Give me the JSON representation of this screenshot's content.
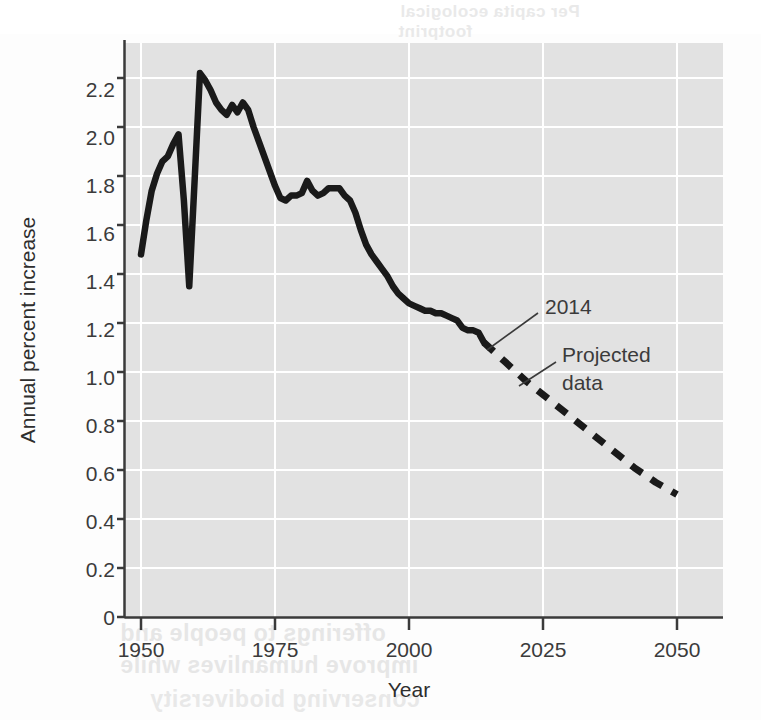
{
  "chart_data": {
    "type": "line",
    "title": "",
    "xlabel": "Year",
    "ylabel": "Annual percent increase",
    "xlim": [
      1950,
      2050
    ],
    "ylim": [
      0,
      2.3
    ],
    "xticks": [
      "1950",
      "1975",
      "2000",
      "2025",
      "2050"
    ],
    "xtick_values": [
      1950,
      1975,
      2000,
      2025,
      2050
    ],
    "yticks": [
      "0",
      "0.2",
      "0.4",
      "0.6",
      "0.8",
      "1.0",
      "1.2",
      "1.4",
      "1.6",
      "1.8",
      "2.0",
      "2.2"
    ],
    "ytick_values": [
      0,
      0.2,
      0.4,
      0.6,
      0.8,
      1.0,
      1.2,
      1.4,
      1.6,
      1.8,
      2.0,
      2.2
    ],
    "grid": true,
    "legend": "none",
    "plot_bg_color": "#e2e2e2",
    "grid_color": "#ffffff",
    "line_color": "#1a1a1a",
    "series": [
      {
        "name": "Historical data",
        "style": "solid",
        "x": [
          1950,
          1951,
          1952,
          1953,
          1954,
          1955,
          1956,
          1957,
          1958,
          1959,
          1960,
          1961,
          1962,
          1963,
          1964,
          1965,
          1966,
          1967,
          1968,
          1969,
          1970,
          1971,
          1972,
          1973,
          1974,
          1975,
          1976,
          1977,
          1978,
          1979,
          1980,
          1981,
          1982,
          1983,
          1984,
          1985,
          1986,
          1987,
          1988,
          1989,
          1990,
          1991,
          1992,
          1993,
          1994,
          1995,
          1996,
          1997,
          1998,
          1999,
          2000,
          2001,
          2002,
          2003,
          2004,
          2005,
          2006,
          2007,
          2008,
          2009,
          2010,
          2011,
          2012,
          2013,
          2014
        ],
        "y": [
          1.48,
          1.62,
          1.74,
          1.81,
          1.86,
          1.88,
          1.93,
          1.97,
          1.7,
          1.35,
          1.78,
          2.22,
          2.19,
          2.15,
          2.1,
          2.07,
          2.05,
          2.09,
          2.06,
          2.1,
          2.07,
          2.0,
          1.94,
          1.88,
          1.82,
          1.76,
          1.71,
          1.7,
          1.72,
          1.72,
          1.73,
          1.78,
          1.74,
          1.72,
          1.73,
          1.75,
          1.75,
          1.75,
          1.72,
          1.7,
          1.65,
          1.58,
          1.52,
          1.48,
          1.45,
          1.42,
          1.39,
          1.35,
          1.32,
          1.3,
          1.28,
          1.27,
          1.26,
          1.25,
          1.25,
          1.24,
          1.24,
          1.23,
          1.22,
          1.21,
          1.18,
          1.17,
          1.17,
          1.16,
          1.12
        ]
      },
      {
        "name": "Projected data",
        "style": "dashed",
        "x": [
          2014,
          2018,
          2022,
          2026,
          2030,
          2034,
          2038,
          2042,
          2046,
          2050
        ],
        "y": [
          1.12,
          1.04,
          0.96,
          0.89,
          0.82,
          0.75,
          0.68,
          0.61,
          0.55,
          0.5
        ]
      }
    ],
    "annotations": [
      {
        "text": "2014",
        "x": 2024,
        "y": 1.25,
        "points_to_x": 2014,
        "points_to_y": 1.12
      },
      {
        "text": "Projected",
        "x": 2027,
        "y": 1.02,
        "points_to_x": 2021,
        "points_to_y": 0.94
      },
      {
        "text": "data",
        "x": 2027,
        "y": 0.9
      }
    ]
  },
  "axis": {
    "y_title": "Annual percent increase",
    "x_title": "Year"
  },
  "labels": {
    "y0": "0",
    "y1": "0.2",
    "y2": "0.4",
    "y3": "0.6",
    "y4": "0.8",
    "y5": "1.0",
    "y6": "1.2",
    "y7": "1.4",
    "y8": "1.6",
    "y9": "1.8",
    "y10": "2.0",
    "y11": "2.2",
    "x0": "1950",
    "x1": "1975",
    "x2": "2000",
    "x3": "2025",
    "x4": "2050"
  },
  "annotations": {
    "year_marker": "2014",
    "projected_line1": "Projected",
    "projected_line2": "data"
  },
  "bleed_text": {
    "t1": "Per capita ecological",
    "t2": "footprint",
    "t3": "43.5% Per capita ecol",
    "t4": "print by country",
    "t5": "Per capita footprint",
    "t6": "resources used per",
    "t7": "person per year",
    "t8": "Carrying capacity",
    "t9": "sustainable level",
    "t10": "offerings to people and",
    "t11": "improve humanlives while",
    "t12": "conserving biodiversity"
  }
}
